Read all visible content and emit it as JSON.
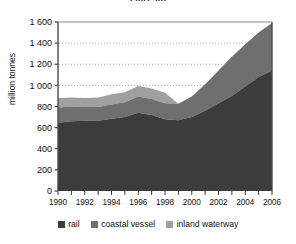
{
  "title": "2007-08",
  "axis": {
    "y_title": "million tonnes",
    "y_ticks": [
      "0",
      "200",
      "400",
      "600",
      "800",
      "1 000",
      "1 200",
      "1 400",
      "1 600"
    ],
    "x_ticks": [
      "1990",
      "1992",
      "1994",
      "1996",
      "1998",
      "2000",
      "2002",
      "2004",
      "2006"
    ]
  },
  "legend": {
    "items": [
      {
        "label": "rail",
        "color": "#3c3c3c"
      },
      {
        "label": "coastal vessel",
        "color": "#6f6f6f"
      },
      {
        "label": "inland waterway",
        "color": "#a0a0a0"
      }
    ]
  },
  "chart_data": {
    "type": "area",
    "stacked": true,
    "title": "2007-08",
    "xlabel": "",
    "ylabel": "million tonnes",
    "ylim": [
      0,
      1600
    ],
    "xlim": [
      1990,
      2006
    ],
    "grid": "horizontal-dotted-above-1000",
    "legend_position": "bottom",
    "x": [
      1990,
      1991,
      1992,
      1993,
      1994,
      1995,
      1996,
      1997,
      1998,
      1999,
      2000,
      2001,
      2002,
      2003,
      2004,
      2005,
      2006
    ],
    "categories": [
      "1990",
      "1991",
      "1992",
      "1993",
      "1994",
      "1995",
      "1996",
      "1997",
      "1998",
      "1999",
      "2000",
      "2001",
      "2002",
      "2003",
      "2004",
      "2005",
      "2006"
    ],
    "series": [
      {
        "name": "rail",
        "color": "#3c3c3c",
        "values": [
          645,
          660,
          665,
          665,
          685,
          700,
          740,
          720,
          680,
          670,
          700,
          760,
          830,
          900,
          990,
          1080,
          1140
        ]
      },
      {
        "name": "coastal vessel",
        "color": "#6f6f6f",
        "values": [
          145,
          140,
          130,
          130,
          135,
          140,
          155,
          150,
          150,
          155,
          195,
          250,
          310,
          370,
          400,
          420,
          450
        ]
      },
      {
        "name": "inland waterway",
        "color": "#a0a0a0",
        "values": [
          90,
          85,
          85,
          90,
          95,
          95,
          100,
          100,
          100,
          null,
          null,
          null,
          null,
          null,
          null,
          null,
          null
        ]
      }
    ],
    "totals": [
      880,
      885,
      880,
      885,
      915,
      935,
      995,
      970,
      930,
      825,
      895,
      1010,
      1140,
      1270,
      1390,
      1500,
      1590
    ]
  }
}
